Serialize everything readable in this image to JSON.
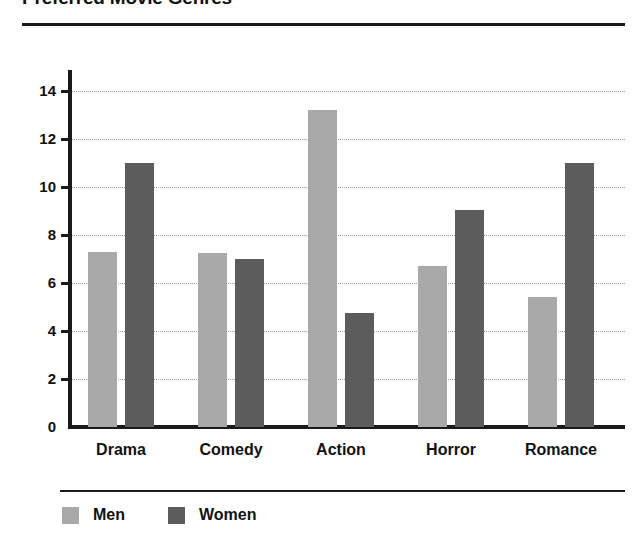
{
  "chart_data": {
    "type": "bar",
    "title": "Preferred Movie Genres",
    "xlabel": "",
    "ylabel": "",
    "categories": [
      "Drama",
      "Comedy",
      "Action",
      "Horror",
      "Romance"
    ],
    "series": [
      {
        "name": "Men",
        "color": "#a9a9a9",
        "values": [
          7.3,
          7.25,
          13.2,
          6.7,
          5.4
        ]
      },
      {
        "name": "Women",
        "color": "#5c5c5c",
        "values": [
          11.0,
          7.0,
          4.75,
          9.05,
          11.0
        ]
      }
    ],
    "ylim": [
      0,
      14.8
    ],
    "yticks": [
      0,
      2,
      4,
      6,
      8,
      10,
      12,
      14
    ],
    "ytick_labels": [
      "0",
      "2",
      "4",
      "6",
      "8",
      "10",
      "12",
      "14"
    ],
    "grid": "horizontal-dotted",
    "legend_position": "bottom-left",
    "legend": [
      "Men",
      "Women"
    ]
  }
}
